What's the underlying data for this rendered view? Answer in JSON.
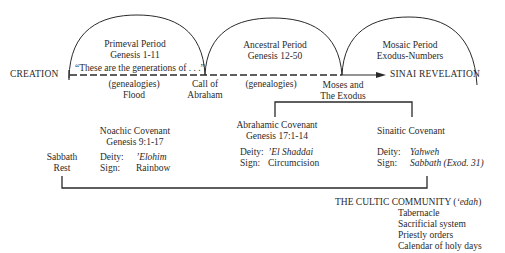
{
  "timeline": {
    "start_label": "CREATION",
    "end_label": "SINAI REVELATION",
    "quote": "“These are the generations of . . .”",
    "periods": [
      {
        "name": "Primeval Period",
        "ref": "Genesis 1-11"
      },
      {
        "name": "Ancestral Period",
        "ref": "Genesis 12-50"
      },
      {
        "name": "Mosaic Period",
        "ref": "Exodus-Numbers"
      }
    ],
    "below_labels": {
      "genealogies_1": "(genealogies)",
      "flood": "Flood",
      "call_1": "Call of",
      "call_2": "Abraham",
      "genealogies_2": "(genealogies)",
      "moses_1": "Moses and",
      "moses_2": "The Exodus"
    }
  },
  "sabbath": {
    "line1": "Sabbath",
    "line2": "Rest"
  },
  "covenants": [
    {
      "name": "Noachic Covenant",
      "ref": "Genesis 9:1-17",
      "deity_label": "Deity:",
      "deity": "’Elohim",
      "sign_label": "Sign:",
      "sign": "Rainbow"
    },
    {
      "name": "Abrahamic Covenant",
      "ref": "Genesis 17:1-14",
      "deity_label": "Deity:",
      "deity": "’El Shaddai",
      "sign_label": "Sign:",
      "sign": "Circumcision"
    },
    {
      "name": "Sinaitic Covenant",
      "ref": "",
      "deity_label": "Deity:",
      "deity": "Yahweh",
      "sign_label": "Sign:",
      "sign": "Sabbath (Exod. 31)"
    }
  ],
  "community": {
    "title": "THE CULTIC COMMUNITY (",
    "title_term": "‘edah",
    "title_close": ")",
    "items": [
      "Tabernacle",
      "Sacrificial system",
      "Priestly orders",
      "Calendar of holy days"
    ]
  }
}
